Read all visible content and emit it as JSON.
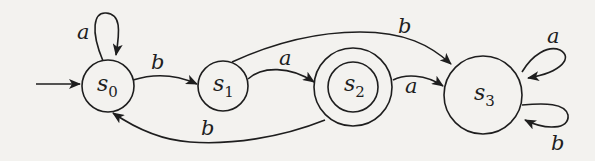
{
  "diagram": {
    "type": "finite-automaton",
    "colors": {
      "background": "#f3f2ef",
      "stroke": "#1e1e1e"
    },
    "states": [
      {
        "id": "s0",
        "name": "s",
        "subscript": "0",
        "initial": true,
        "accepting": false
      },
      {
        "id": "s1",
        "name": "s",
        "subscript": "1",
        "initial": false,
        "accepting": false
      },
      {
        "id": "s2",
        "name": "s",
        "subscript": "2",
        "initial": false,
        "accepting": true
      },
      {
        "id": "s3",
        "name": "s",
        "subscript": "3",
        "initial": false,
        "accepting": false
      }
    ],
    "transitions": [
      {
        "from": "s0",
        "to": "s0",
        "label": "a"
      },
      {
        "from": "s0",
        "to": "s1",
        "label": "b"
      },
      {
        "from": "s1",
        "to": "s2",
        "label": "a"
      },
      {
        "from": "s1",
        "to": "s3",
        "label": "b"
      },
      {
        "from": "s2",
        "to": "s3",
        "label": "a"
      },
      {
        "from": "s2",
        "to": "s0",
        "label": "b"
      },
      {
        "from": "s3",
        "to": "s3",
        "label": "a"
      },
      {
        "from": "s3",
        "to": "s3",
        "label": "b"
      }
    ]
  }
}
